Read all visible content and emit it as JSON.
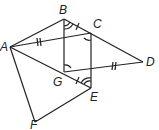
{
  "diagram": {
    "type": "geometry",
    "points": {
      "A": {
        "label": "A",
        "x": 10,
        "y": 47
      },
      "B": {
        "label": "B",
        "x": 64,
        "y": 19
      },
      "C": {
        "label": "C",
        "x": 91,
        "y": 33
      },
      "D": {
        "label": "D",
        "x": 143,
        "y": 62
      },
      "G": {
        "label": "G",
        "x": 64,
        "y": 72
      },
      "E": {
        "label": "E",
        "x": 91,
        "y": 88
      },
      "F": {
        "label": "F",
        "x": 35,
        "y": 122
      }
    },
    "segments": [
      "AB",
      "BD",
      "AC",
      "GD",
      "AE",
      "BG",
      "CE",
      "AF",
      "FE"
    ],
    "congruent_marks": {
      "single_tick": [
        "BC",
        "GE"
      ],
      "double_tick": [
        "AC",
        "GD"
      ]
    },
    "angle_marks": {
      "double_arc": [
        "B",
        "E"
      ],
      "single_arc": [
        "C",
        "G"
      ]
    },
    "stroke_color": "#222222"
  }
}
